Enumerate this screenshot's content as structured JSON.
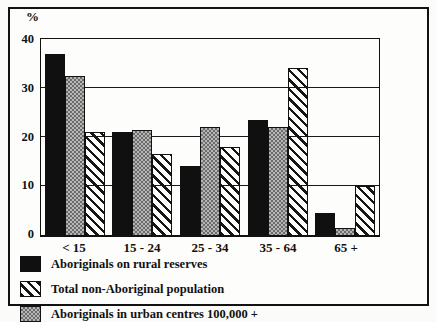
{
  "chart_data": {
    "type": "bar",
    "title": "",
    "xlabel": "",
    "ylabel": "%",
    "ylim": [
      0,
      40
    ],
    "yticks": [
      0,
      10,
      20,
      30,
      40
    ],
    "grid": "horizontal",
    "legend_position": "below",
    "categories": [
      "< 15",
      "15 - 24",
      "25 - 34",
      "35 - 64",
      "65 +"
    ],
    "series": [
      {
        "name": "Aboriginals on rural reserves",
        "pattern": "solid-black",
        "values": [
          37,
          21,
          14,
          23.5,
          4.5
        ]
      },
      {
        "name": "Aboriginals in urban centres 100,000 +",
        "pattern": "gray-checker",
        "values": [
          32.5,
          21.5,
          22,
          22,
          1.5
        ]
      },
      {
        "name": "Total non-Aboriginal population",
        "pattern": "diagonal-hatch",
        "values": [
          21,
          16.5,
          18,
          34,
          10
        ]
      }
    ],
    "legend_display_order": [
      0,
      2,
      1
    ]
  },
  "colors": {
    "ink": "#111111",
    "paper": "#fdfdfc",
    "checker_dark": "#6b6b6b",
    "checker_light": "#b6b6b6"
  }
}
